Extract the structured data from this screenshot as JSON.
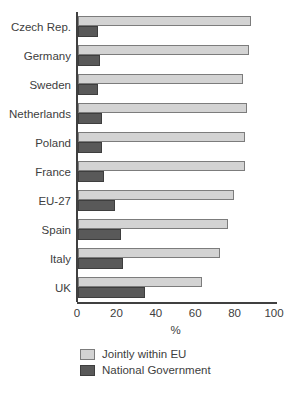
{
  "chart_data": {
    "type": "bar",
    "orientation": "horizontal",
    "title": "",
    "xlabel": "%",
    "ylabel": "",
    "xlim": [
      0,
      100
    ],
    "xticks": [
      0,
      20,
      40,
      60,
      80,
      100
    ],
    "grid": false,
    "legend_position": "bottom-left",
    "categories": [
      "Czech Rep.",
      "Germany",
      "Sweden",
      "Netherlands",
      "Poland",
      "France",
      "EU-27",
      "Spain",
      "Italy",
      "UK"
    ],
    "series": [
      {
        "name": "Jointly within EU",
        "color": "#d3d3d3",
        "border_color": "#7c7c7c",
        "values": [
          88,
          87,
          84,
          86,
          85,
          85,
          79,
          76,
          72,
          63
        ]
      },
      {
        "name": "National Government",
        "color": "#595959",
        "border_color": "#3e3e3e",
        "values": [
          10,
          11,
          10,
          12,
          12,
          13,
          19,
          22,
          23,
          34
        ]
      }
    ],
    "axis_color": "#404040",
    "text_color": "#404040"
  }
}
